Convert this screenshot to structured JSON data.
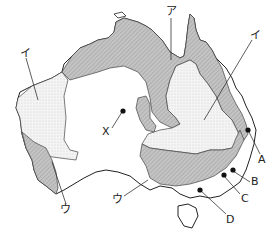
{
  "map": {
    "subject": "Australia",
    "labels": {
      "a_north": "ア",
      "i_west": "イ",
      "i_east": "イ",
      "u_west": "ウ",
      "u_south": "ウ",
      "x": "X",
      "A": "A",
      "B": "B",
      "C": "C",
      "D": "D"
    },
    "legend_zones": [
      {
        "name": "hatched-zone",
        "pattern": "dark diagonal hatch",
        "color": "#b8b8b8"
      },
      {
        "name": "dotted-zone",
        "pattern": "light stipple",
        "color": "#eeeeee"
      },
      {
        "name": "blank-zone",
        "pattern": "none",
        "color": "#ffffff"
      }
    ]
  }
}
